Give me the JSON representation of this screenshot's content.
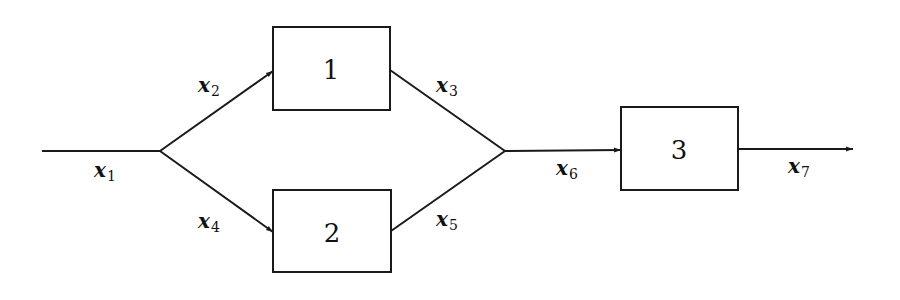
{
  "diagram": {
    "type": "block-diagram",
    "colors": {
      "stroke": "#1a1a1a",
      "background": "#ffffff",
      "text": "#111111"
    },
    "blocks": [
      {
        "id": "1",
        "label": "1"
      },
      {
        "id": "2",
        "label": "2"
      },
      {
        "id": "3",
        "label": "3"
      }
    ],
    "signals": [
      {
        "id": "x1",
        "base": "x",
        "sub": "1",
        "from": "input",
        "to": "split"
      },
      {
        "id": "x2",
        "base": "x",
        "sub": "2",
        "from": "split",
        "to": "1"
      },
      {
        "id": "x3",
        "base": "x",
        "sub": "3",
        "from": "1",
        "to": "merge"
      },
      {
        "id": "x4",
        "base": "x",
        "sub": "4",
        "from": "split",
        "to": "2"
      },
      {
        "id": "x5",
        "base": "x",
        "sub": "5",
        "from": "2",
        "to": "merge"
      },
      {
        "id": "x6",
        "base": "x",
        "sub": "6",
        "from": "merge",
        "to": "3"
      },
      {
        "id": "x7",
        "base": "x",
        "sub": "7",
        "from": "3",
        "to": "output"
      }
    ]
  }
}
